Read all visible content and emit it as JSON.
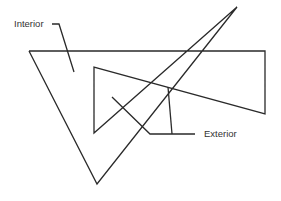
{
  "diagram": {
    "title": "",
    "labels": {
      "interior": "Interior",
      "exterior": "Exterior"
    },
    "colors": {
      "line": "#2a2a2a",
      "text": "#333333",
      "background": "#ffffff"
    },
    "shapes": {
      "polygon_outline": [
        [
          29,
          51
        ],
        [
          265,
          51
        ],
        [
          265,
          114
        ],
        [
          94,
          67
        ],
        [
          94,
          133
        ],
        [
          237,
          7
        ],
        [
          97,
          184
        ],
        [
          29,
          51
        ]
      ],
      "interior_leader": [
        [
          52,
          24
        ],
        [
          59,
          24
        ],
        [
          74,
          72
        ]
      ],
      "exterior_leader_a": [
        [
          112,
          97
        ],
        [
          150,
          134
        ],
        [
          195,
          134
        ]
      ],
      "exterior_leader_b": [
        [
          168,
          87
        ],
        [
          172,
          134
        ]
      ]
    }
  }
}
